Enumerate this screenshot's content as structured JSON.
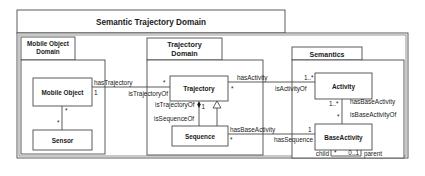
{
  "diagram": {
    "type": "uml-package-class-diagram",
    "packages": {
      "outer": {
        "title": "Semantic Trajectory Domain"
      },
      "mobile": {
        "title_line1": "Mobile Object",
        "title_line2": "Domain"
      },
      "trajectory": {
        "title_line1": "Trajectory",
        "title_line2": "Domain"
      },
      "semantics": {
        "title": "Semantics"
      }
    },
    "classes": {
      "mobile_object": "Mobile Object",
      "sensor": "Sensor",
      "trajectory": "Trajectory",
      "sequence": "Sequence",
      "activity": "Activity",
      "base_activity": "BaseActivity"
    },
    "associations": {
      "mo_traj": {
        "role_a": "hasTrajectory",
        "role_b": "isTrajectoryOf",
        "mult_a": "1",
        "mult_b": "*"
      },
      "mo_sensor": {
        "mult_a": "*",
        "mult_b": "*"
      },
      "traj_seq": {
        "role_a": "isTrajectoryOf",
        "role_b": "isSequenceOf",
        "mult_a": "1"
      },
      "traj_activity": {
        "role_a": "hasActivity",
        "role_b": "isActivityOf",
        "mult_a": "*",
        "mult_b": "1..*"
      },
      "activity_base": {
        "role_a": "hasBaseActivity",
        "role_b": "isBaseActivityOf",
        "mult_a": "1..*",
        "mult_b": "*"
      },
      "seq_base": {
        "role_a": "hasBaseActivity",
        "role_b": "hasSequence",
        "mult_a": "*",
        "mult_b": "1"
      },
      "base_self": {
        "role_a": "child",
        "role_b": "parent",
        "mult_a": "*",
        "mult_b": "0..1"
      }
    }
  }
}
